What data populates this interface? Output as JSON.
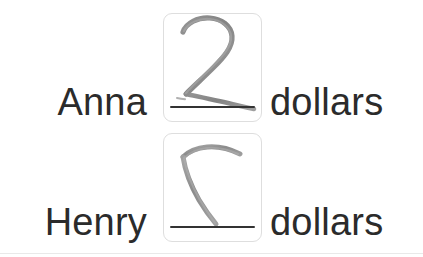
{
  "page": {
    "background_color": "#ffffff",
    "text_color": "#2b2b2b",
    "box_border_color": "#dedede",
    "blank_rule_color": "#333333",
    "ink_color": "#8a8a8a",
    "divider_color": "#e9e9e9"
  },
  "rows": [
    {
      "name": "Anna",
      "unit": "dollars",
      "answer": {
        "handwriting": "2",
        "state": "completed",
        "ink_name": "handwritten-digit-two"
      }
    },
    {
      "name": "Henry",
      "unit": "dollars",
      "answer": {
        "handwriting": "",
        "state": "in-progress",
        "ink_name": "handwritten-stroke-partial"
      }
    }
  ]
}
